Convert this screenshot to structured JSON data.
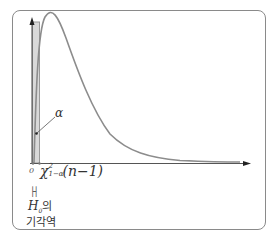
{
  "diagram": {
    "title": "",
    "type": "chi-square distribution left-tailed rejection region",
    "colors": {
      "frame": "#8a8a8a",
      "curve": "#888888",
      "axis": "#444444",
      "shaded_region": "#d6d6d6"
    },
    "labels": {
      "origin": "0",
      "critical_symbol": "χ",
      "critical_subscript": "1−α",
      "critical_superscript": "2",
      "critical_args": "(n−1)",
      "alpha": "α",
      "bracket": "├┤",
      "h0_symbol": "H",
      "h0_subscript": "0",
      "h0_suffix": "의",
      "rejection_region": "기각역"
    }
  }
}
